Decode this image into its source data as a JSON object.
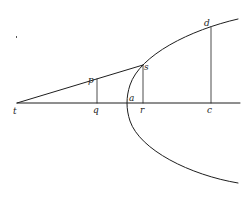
{
  "figure": {
    "stroke_color": "#1e1e1e",
    "background_color": "#ffffff",
    "labels": {
      "t": "t",
      "q": "q",
      "p": "p",
      "a": "a",
      "s": "s",
      "r": "r",
      "d": "d",
      "c": "c"
    }
  }
}
